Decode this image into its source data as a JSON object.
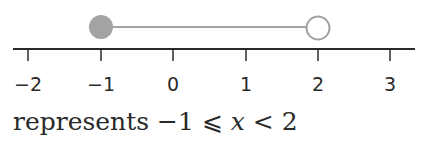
{
  "number_line": {
    "ticks": [
      {
        "value": -2,
        "label": "−2",
        "x": 28
      },
      {
        "value": -1,
        "label": "−1",
        "x": 101
      },
      {
        "value": 0,
        "label": "0",
        "x": 173
      },
      {
        "value": 1,
        "label": "1",
        "x": 246
      },
      {
        "value": 2,
        "label": "2",
        "x": 318
      },
      {
        "value": 3,
        "label": "3",
        "x": 390
      }
    ],
    "interval": {
      "start": -1,
      "start_closed": true,
      "end": 2,
      "end_closed": false
    },
    "colors": {
      "axis": "#2a2a2a",
      "interval": "#a3a3a3"
    }
  },
  "caption": {
    "prefix": "represents −1 ⩽ ",
    "variable": "x",
    "suffix": " < 2"
  }
}
